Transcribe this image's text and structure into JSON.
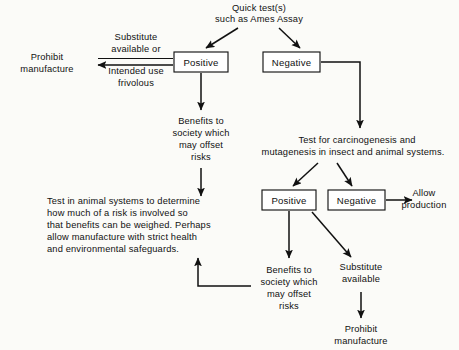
{
  "diagram": {
    "colors": {
      "background": "#fbfbf8",
      "ink": "#111111",
      "box_fill": "#ffffff",
      "box_stroke": "#151515"
    },
    "nodes": {
      "quick_test": {
        "lines": [
          "Quick test(s)",
          "such as Ames Assay"
        ]
      },
      "top_positive": {
        "label": "Positive"
      },
      "top_negative": {
        "label": "Negative"
      },
      "prohibit_manufacture_left": {
        "lines": [
          "Prohibit",
          "manufacture"
        ]
      },
      "substitute_or_intended_use": {
        "above_lines": [
          "Substitute",
          "available or"
        ],
        "below_lines": [
          "Intended use",
          "frivolous"
        ]
      },
      "benefits_upper": {
        "lines": [
          "Benefits to",
          "society which",
          "may offset",
          "risks"
        ]
      },
      "carcinogenesis_test": {
        "lines": [
          "Test for carcinogenesis and",
          "mutagenesis in insect and animal systems."
        ]
      },
      "lower_positive": {
        "label": "Positive"
      },
      "lower_negative": {
        "label": "Negative"
      },
      "allow_production": {
        "lines": [
          "Allow",
          "production"
        ]
      },
      "animal_systems_block": {
        "lines": [
          "Test in animal systems to determine",
          "how much of a risk is involved so",
          "that benefits can be weighed. Perhaps",
          "allow manufacture with strict health",
          "and environmental safeguards."
        ]
      },
      "benefits_lower": {
        "lines": [
          "Benefits to",
          "society which",
          "may offset",
          "risks"
        ]
      },
      "substitute_available": {
        "lines": [
          "Substitute",
          "available"
        ]
      },
      "prohibit_manufacture_bottom": {
        "lines": [
          "Prohibit",
          "manufacture"
        ]
      }
    },
    "edges": [
      {
        "from": "quick_test",
        "to": "top_positive",
        "style": "diagonal-arrow"
      },
      {
        "from": "quick_test",
        "to": "top_negative",
        "style": "diagonal-arrow"
      },
      {
        "from": "top_positive",
        "to": "prohibit_manufacture_left",
        "style": "horizontal-arrow-left",
        "label": "Substitute available or / Intended use frivolous"
      },
      {
        "from": "top_positive",
        "to": "benefits_upper",
        "style": "vertical-arrow-down"
      },
      {
        "from": "benefits_upper",
        "to": "animal_systems_block",
        "style": "vertical-arrow-down"
      },
      {
        "from": "top_negative",
        "to": "carcinogenesis_test",
        "style": "elbow-right-down-arrow"
      },
      {
        "from": "carcinogenesis_test",
        "to": "lower_positive",
        "style": "diagonal-arrow"
      },
      {
        "from": "carcinogenesis_test",
        "to": "lower_negative",
        "style": "diagonal-arrow"
      },
      {
        "from": "lower_negative",
        "to": "allow_production",
        "style": "horizontal-arrow-right"
      },
      {
        "from": "lower_positive",
        "to": "benefits_lower",
        "style": "vertical-arrow-down"
      },
      {
        "from": "lower_positive",
        "to": "substitute_available",
        "style": "diagonal-arrow"
      },
      {
        "from": "benefits_lower",
        "to": "animal_systems_block",
        "style": "elbow-left-up-arrow"
      },
      {
        "from": "substitute_available",
        "to": "prohibit_manufacture_bottom",
        "style": "vertical-arrow-down"
      }
    ]
  }
}
